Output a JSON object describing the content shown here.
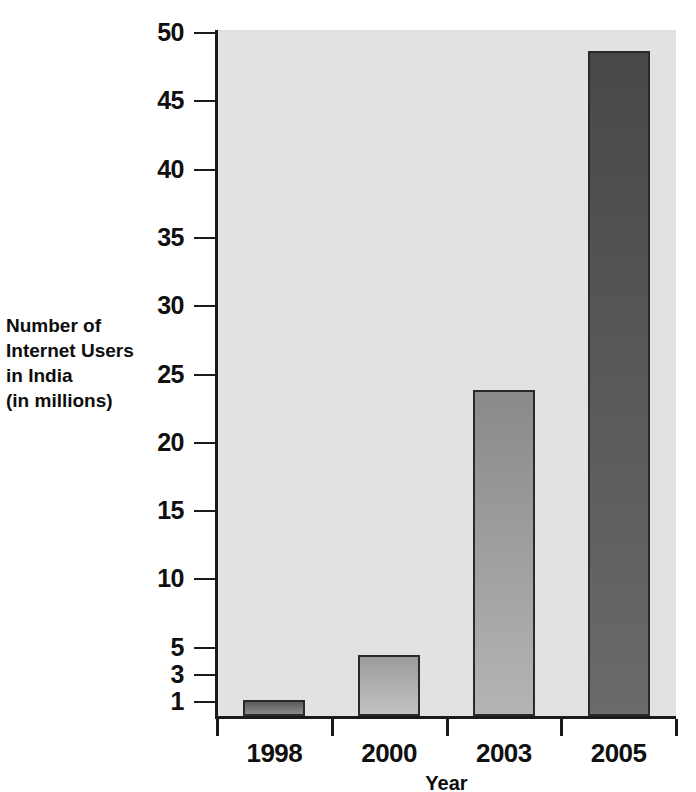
{
  "chart_data": {
    "type": "bar",
    "title": "",
    "xlabel": "Year",
    "ylabel": "Number of Internet Users in India (in millions)",
    "ylabel_lines": [
      "Number of",
      "Internet Users",
      "in India",
      "(in millions)"
    ],
    "categories": [
      "1998",
      "2000",
      "2003",
      "2005"
    ],
    "values": [
      1.2,
      4.5,
      23.9,
      48.7
    ],
    "ylim": [
      0,
      50
    ],
    "ytick_labels": [
      "1",
      "3",
      "5",
      "10",
      "15",
      "20",
      "25",
      "30",
      "35",
      "40",
      "45",
      "50"
    ],
    "ytick_values": [
      1,
      3,
      5,
      10,
      15,
      20,
      25,
      30,
      35,
      40,
      45,
      50
    ],
    "grid": false,
    "legend": "none",
    "plot_background": "#e2e2e2",
    "bar_colors": [
      "#6e6e6e",
      "#9a9a9a",
      "#8d8d8d",
      "#4f4f4f"
    ],
    "bar_edge_color": "#2a2a2a",
    "axis_color": "#1a1a1a",
    "bars": [
      {
        "category": "1998",
        "value": 1.2,
        "fill_top": "#5a5a5a",
        "fill_bottom": "#8c8c8c"
      },
      {
        "category": "2000",
        "value": 4.5,
        "fill_top": "#9c9c9c",
        "fill_bottom": "#c2c2c2"
      },
      {
        "category": "2003",
        "value": 23.9,
        "fill_top": "#8a8a8a",
        "fill_bottom": "#b4b4b4"
      },
      {
        "category": "2005",
        "value": 48.7,
        "fill_top": "#484848",
        "fill_bottom": "#6a6a6a"
      }
    ]
  }
}
